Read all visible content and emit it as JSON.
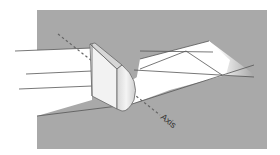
{
  "diagram": {
    "labels": {
      "axis": "Axis"
    },
    "colors": {
      "background_panel": "#a9a9a9",
      "beam": "#ffffff",
      "lens_face": "#f2f2f2",
      "lens_curved": "#e6e6e6",
      "lens_top": "#dcdcdc",
      "ray_line": "#555555",
      "axis_dash": "#666666"
    },
    "elements": [
      {
        "name": "background-panel",
        "type": "rectangle"
      },
      {
        "name": "incoming-beam",
        "type": "collimated light beam"
      },
      {
        "name": "cylindrical-lens",
        "type": "plano-convex cylindrical lens"
      },
      {
        "name": "outgoing-beam",
        "type": "converging/diverging light beam"
      },
      {
        "name": "optical-axis",
        "type": "dashed line",
        "label": "Axis"
      },
      {
        "name": "rays",
        "type": "ray lines",
        "count": 5
      }
    ]
  }
}
